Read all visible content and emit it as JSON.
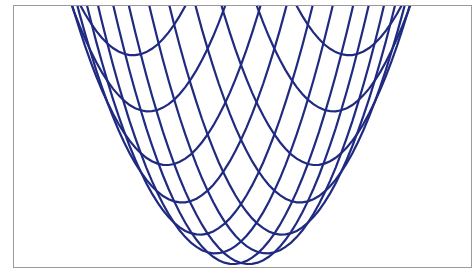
{
  "colors": {
    "line": "#1f2a80",
    "frame": "#9a9a9a",
    "background": "#ffffff"
  },
  "chart_data": {
    "type": "wireframe-surface",
    "title": "",
    "xlabel": "",
    "ylabel": "",
    "zlabel": "",
    "surface": "z = x^2 + y^2 (paraboloid)",
    "grid_lines_per_direction": 11,
    "domain": [
      -1,
      1
    ],
    "axes_visible": false,
    "legend": null
  }
}
